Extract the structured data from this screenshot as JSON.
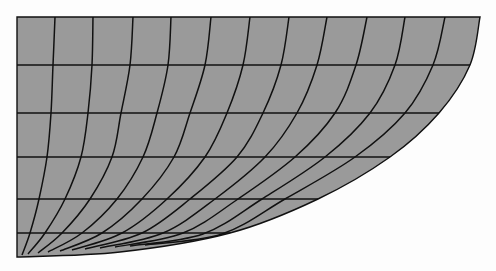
{
  "figure": {
    "colors": {
      "fill": "#9a9a9a",
      "line": "#111111",
      "background": "#fdfdfd"
    },
    "boundary": [
      [
        17,
        17
      ],
      [
        480,
        17
      ],
      [
        470,
        65
      ],
      [
        439,
        113
      ],
      [
        390,
        157
      ],
      [
        318,
        199
      ],
      [
        230,
        233
      ],
      [
        120,
        252
      ],
      [
        17,
        257
      ]
    ],
    "horizontal_lines": [
      {
        "y": 65,
        "x_end": 470
      },
      {
        "y": 113,
        "x_end": 439
      },
      {
        "y": 157,
        "x_end": 390
      },
      {
        "y": 199,
        "x_end": 318
      },
      {
        "y": 233,
        "x_end": 230
      }
    ],
    "vertical_curves": [
      [
        [
          55,
          17
        ],
        [
          53,
          65
        ],
        [
          51,
          113
        ],
        [
          47,
          157
        ],
        [
          39,
          199
        ],
        [
          30,
          233
        ],
        [
          22,
          255
        ]
      ],
      [
        [
          93,
          17
        ],
        [
          92,
          65
        ],
        [
          88,
          113
        ],
        [
          81,
          157
        ],
        [
          65,
          199
        ],
        [
          45,
          233
        ],
        [
          28,
          254
        ]
      ],
      [
        [
          133,
          17
        ],
        [
          130,
          65
        ],
        [
          121,
          113
        ],
        [
          112,
          157
        ],
        [
          90,
          199
        ],
        [
          62,
          233
        ],
        [
          38,
          253
        ]
      ],
      [
        [
          171,
          17
        ],
        [
          168,
          65
        ],
        [
          157,
          113
        ],
        [
          143,
          157
        ],
        [
          117,
          199
        ],
        [
          82,
          233
        ],
        [
          48,
          252
        ]
      ],
      [
        [
          211,
          17
        ],
        [
          205,
          65
        ],
        [
          190,
          113
        ],
        [
          174,
          157
        ],
        [
          142,
          199
        ],
        [
          102,
          233
        ],
        [
          60,
          251
        ]
      ],
      [
        [
          250,
          17
        ],
        [
          243,
          65
        ],
        [
          227,
          113
        ],
        [
          205,
          157
        ],
        [
          167,
          199
        ],
        [
          122,
          233
        ],
        [
          72,
          250
        ]
      ],
      [
        [
          289,
          17
        ],
        [
          281,
          65
        ],
        [
          263,
          113
        ],
        [
          237,
          157
        ],
        [
          190,
          199
        ],
        [
          142,
          233
        ],
        [
          85,
          249
        ]
      ],
      [
        [
          327,
          17
        ],
        [
          317,
          65
        ],
        [
          297,
          113
        ],
        [
          265,
          157
        ],
        [
          215,
          199
        ],
        [
          163,
          233
        ],
        [
          100,
          248
        ]
      ],
      [
        [
          367,
          17
        ],
        [
          356,
          65
        ],
        [
          335,
          113
        ],
        [
          295,
          157
        ],
        [
          238,
          199
        ],
        [
          183,
          233
        ],
        [
          115,
          247
        ]
      ],
      [
        [
          405,
          17
        ],
        [
          395,
          65
        ],
        [
          370,
          113
        ],
        [
          325,
          157
        ],
        [
          262,
          199
        ],
        [
          203,
          234
        ],
        [
          130,
          246
        ]
      ],
      [
        [
          445,
          17
        ],
        [
          433,
          65
        ],
        [
          405,
          113
        ],
        [
          355,
          157
        ],
        [
          285,
          199
        ],
        [
          222,
          234
        ],
        [
          145,
          245
        ]
      ]
    ]
  }
}
